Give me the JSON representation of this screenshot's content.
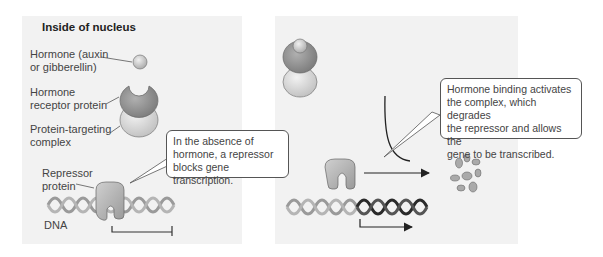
{
  "panel_left": {
    "title": "Inside of nucleus",
    "labels": {
      "hormone": "Hormone (auxin\nor gibberellin)",
      "receptor": "Hormone\nreceptor protein",
      "targeting": "Protein-targeting\ncomplex",
      "repressor": "Repressor\nprotein",
      "dna": "DNA"
    },
    "callout": "In the absence of\nhormone, a repressor\nblocks gene transcription."
  },
  "panel_right": {
    "callout": "Hormone binding activates\nthe complex, which degrades\nthe repressor and allows the\ngene to be transcribed."
  },
  "colors": {
    "panel_bg": "#f2f2f2",
    "hormone": "#c8c8c8",
    "receptor": "#8e8e8e",
    "targeting": "#d8d8d8",
    "repressor": "#b8b8b8",
    "dna_light": "#999999",
    "dna_dark": "#333333"
  }
}
